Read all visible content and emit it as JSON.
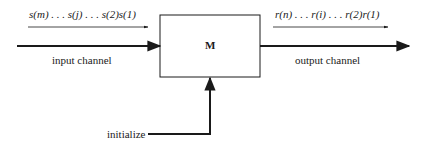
{
  "diagram": {
    "box": {
      "label": "M"
    },
    "input": {
      "sequence": "s(m) . . . s(j) . . . s(2)s(1)",
      "label": "input channel"
    },
    "output": {
      "sequence": "r(n) . . . r(i) . . . r(2)r(1)",
      "label": "output channel"
    },
    "control": {
      "label": "initialize"
    },
    "colors": {
      "line": "#1a1a1a",
      "background": "#ffffff"
    }
  }
}
